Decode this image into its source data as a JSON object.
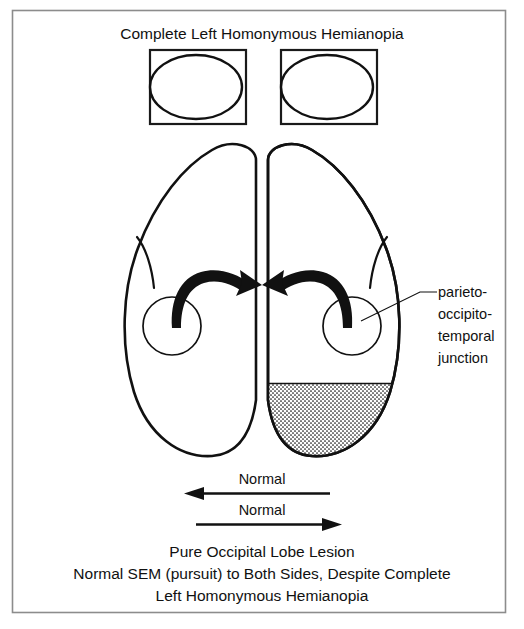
{
  "figure": {
    "title": "Complete Left Homonymous Hemianopia",
    "caption_lines": [
      "Pure Occipital Lobe Lesion",
      "Normal SEM (pursuit) to Both Sides, Despite Complete",
      "Left Homonymous Hemianopia"
    ]
  },
  "visual_fields": {
    "boxes": [
      {
        "name": "left-eye-field",
        "dark_side": "left"
      },
      {
        "name": "right-eye-field",
        "dark_side": "left"
      }
    ]
  },
  "brain": {
    "callout": {
      "lines": [
        "parieto-",
        "occipito-",
        "temporal",
        "junction"
      ]
    },
    "lesion": {
      "label": "occipital lobe lesion",
      "hemisphere": "right",
      "pattern": "stipple"
    },
    "arrows": [
      {
        "name": "left-pursuit-arrow",
        "direction": "right-inward"
      },
      {
        "name": "right-pursuit-arrow",
        "direction": "left-inward"
      }
    ]
  },
  "pursuit_arrows": [
    {
      "label": "Normal",
      "direction": "left"
    },
    {
      "label": "Normal",
      "direction": "right"
    }
  ],
  "colors": {
    "ink": "#111111",
    "frame": "#8c8c8c",
    "paper": "#ffffff",
    "stipple": "#111111"
  }
}
